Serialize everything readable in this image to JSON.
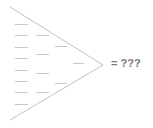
{
  "diagram": {
    "colors": {
      "outline": "#c2c2c2",
      "dash": "#c8c8c8",
      "label": "#7a7a7a",
      "background": "#ffffff"
    },
    "wedge": {
      "top_start": [
        10,
        7
      ],
      "apex": [
        103,
        65
      ],
      "bottom_start": [
        10,
        120
      ]
    },
    "dashes": [
      {
        "x1": 15,
        "x2": 28,
        "y": 24
      },
      {
        "x1": 15,
        "x2": 28,
        "y": 35
      },
      {
        "x1": 15,
        "x2": 28,
        "y": 47
      },
      {
        "x1": 15,
        "x2": 28,
        "y": 58
      },
      {
        "x1": 15,
        "x2": 28,
        "y": 70
      },
      {
        "x1": 15,
        "x2": 28,
        "y": 81
      },
      {
        "x1": 15,
        "x2": 28,
        "y": 92
      },
      {
        "x1": 15,
        "x2": 28,
        "y": 104
      },
      {
        "x1": 36,
        "x2": 49,
        "y": 35
      },
      {
        "x1": 36,
        "x2": 49,
        "y": 54
      },
      {
        "x1": 36,
        "x2": 49,
        "y": 73
      },
      {
        "x1": 36,
        "x2": 49,
        "y": 92
      },
      {
        "x1": 55,
        "x2": 67,
        "y": 46
      },
      {
        "x1": 55,
        "x2": 67,
        "y": 83
      },
      {
        "x1": 73,
        "x2": 84,
        "y": 63
      }
    ],
    "result_label": "= ???"
  }
}
